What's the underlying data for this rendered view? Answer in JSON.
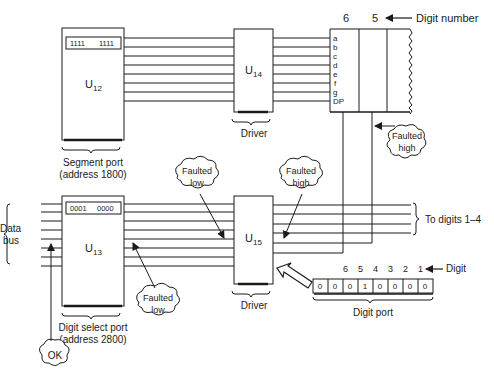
{
  "header": {
    "digit_number_label": "Digit number",
    "display_digits": [
      "6",
      "5"
    ]
  },
  "u12": {
    "label": "U",
    "subscript": "12",
    "register_value_high": "1111",
    "register_value_low": "1111",
    "caption_line1": "Segment port",
    "caption_line2": "(address 1800)"
  },
  "u14": {
    "label": "U",
    "subscript": "14",
    "caption": "Driver"
  },
  "display": {
    "segments": [
      "a",
      "b",
      "c",
      "d",
      "e",
      "f",
      "g",
      "DP"
    ]
  },
  "u13": {
    "label": "U",
    "subscript": "13",
    "register_value_high": "0001",
    "register_value_low": "0000",
    "caption_line1": "Digit select port",
    "caption_line2": "(address 2800)"
  },
  "u15": {
    "label": "U",
    "subscript": "15",
    "caption": "Driver"
  },
  "data_bus": {
    "line1": "Data",
    "line2": "bus"
  },
  "to_digits_label": "To digits 1–4",
  "digit_port": {
    "digit_label": "Digit",
    "digit_numbers": [
      "6",
      "5",
      "4",
      "3",
      "2",
      "1"
    ],
    "bits": [
      "0",
      "0",
      "0",
      "1",
      "0",
      "0",
      "0",
      "0"
    ],
    "caption": "Digit port"
  },
  "callouts": {
    "faulted_high_display": {
      "line1": "Faulted",
      "line2": "high"
    },
    "faulted_low_left": {
      "line1": "Faulted",
      "line2": "low"
    },
    "faulted_high_right": {
      "line1": "Faulted",
      "line2": "high"
    },
    "faulted_low_u13": {
      "line1": "Faulted",
      "line2": "low"
    },
    "ok": {
      "line1": "OK"
    }
  }
}
